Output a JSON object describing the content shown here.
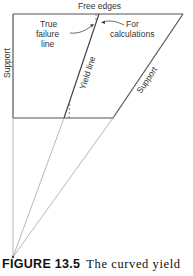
{
  "diagram": {
    "labels": {
      "free_edges": "Free edges",
      "true_failure_line": [
        "True",
        "failure",
        "line"
      ],
      "for_calculations": [
        "For",
        "calculations"
      ],
      "support_left": "Support",
      "support_right": "Support",
      "yield_line": "Yield line"
    },
    "colors": {
      "line": "#555555",
      "thin_line": "#999999",
      "text": "#333333"
    }
  },
  "caption": {
    "figure_label": "FIGURE 13.5",
    "text": "The curved yield"
  }
}
